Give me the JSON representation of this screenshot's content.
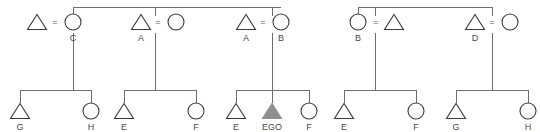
{
  "diagram": {
    "type": "kinship-genealogy",
    "ego_label": "EGO",
    "union_symbol": "=",
    "colors": {
      "line": "#6e6e6e",
      "symbol_stroke": "#3a3a3a",
      "symbol_fill": "#ffffff",
      "ego_fill": "#8f8f8f",
      "label_text": "#4a4a4a",
      "background": "#ffffff"
    },
    "generation_1": {
      "name": "parents-generation",
      "unions": [
        {
          "id": "union-1",
          "left": {
            "shape": "triangle",
            "sex": "male",
            "label": "",
            "cx": 37,
            "cy": 22
          },
          "eq": {
            "x": 55,
            "y": 23
          },
          "right": {
            "shape": "circle",
            "sex": "female",
            "label": "C",
            "cx": 73,
            "cy": 22
          },
          "descent_x": 73
        },
        {
          "id": "union-2",
          "left": {
            "shape": "triangle",
            "sex": "male",
            "label": "A",
            "cx": 141,
            "cy": 22
          },
          "eq": {
            "x": 158,
            "y": 23
          },
          "right": {
            "shape": "circle",
            "sex": "female",
            "label": "",
            "cx": 176,
            "cy": 22
          },
          "descent_x": 155
        },
        {
          "id": "union-3",
          "left": {
            "shape": "triangle",
            "sex": "male",
            "label": "A",
            "cx": 246,
            "cy": 22
          },
          "eq": {
            "x": 263,
            "y": 23
          },
          "right": {
            "shape": "circle",
            "sex": "female",
            "label": "B",
            "cx": 281,
            "cy": 22
          },
          "descent_x": 272
        },
        {
          "id": "union-4",
          "left": {
            "shape": "circle",
            "sex": "female",
            "label": "B",
            "cx": 358,
            "cy": 22
          },
          "eq": {
            "x": 376,
            "y": 23
          },
          "right": {
            "shape": "triangle",
            "sex": "male",
            "label": "",
            "cx": 394,
            "cy": 22
          },
          "descent_x": 375
        },
        {
          "id": "union-5",
          "left": {
            "shape": "triangle",
            "sex": "male",
            "label": "D",
            "cx": 475,
            "cy": 22
          },
          "eq": {
            "x": 492,
            "y": 23
          },
          "right": {
            "shape": "circle",
            "sex": "female",
            "label": "",
            "cx": 510,
            "cy": 22
          },
          "descent_x": 492
        }
      ],
      "sibling_bars": [
        {
          "id": "top-bar-left",
          "y": 7,
          "x1": 73,
          "x2": 281,
          "stubs": [
            73,
            155,
            272
          ]
        },
        {
          "id": "top-bar-right",
          "y": 7,
          "x1": 358,
          "x2": 492,
          "stubs": [
            358,
            375,
            492
          ]
        }
      ]
    },
    "generation_2": {
      "name": "ego-generation",
      "sibling_groups": [
        {
          "id": "sibgroup-1",
          "parent_descent_x": 73,
          "bar_y": 90,
          "bar_x1": 20,
          "bar_x2": 91,
          "children": [
            {
              "shape": "triangle",
              "sex": "male",
              "label": "G",
              "cx": 20,
              "cy": 111,
              "ego": false
            },
            {
              "shape": "circle",
              "sex": "female",
              "label": "H",
              "cx": 91,
              "cy": 111,
              "ego": false
            }
          ]
        },
        {
          "id": "sibgroup-2",
          "parent_descent_x": 155,
          "bar_y": 90,
          "bar_x1": 124,
          "bar_x2": 196,
          "children": [
            {
              "shape": "triangle",
              "sex": "male",
              "label": "E",
              "cx": 124,
              "cy": 111,
              "ego": false
            },
            {
              "shape": "circle",
              "sex": "female",
              "label": "F",
              "cx": 196,
              "cy": 111,
              "ego": false
            }
          ]
        },
        {
          "id": "sibgroup-3",
          "parent_descent_x": 272,
          "bar_y": 90,
          "bar_x1": 236,
          "bar_x2": 309,
          "children": [
            {
              "shape": "triangle",
              "sex": "male",
              "label": "E",
              "cx": 236,
              "cy": 111,
              "ego": false
            },
            {
              "shape": "triangle",
              "sex": "male",
              "label": "EGO",
              "cx": 272,
              "cy": 111,
              "ego": true
            },
            {
              "shape": "circle",
              "sex": "female",
              "label": "F",
              "cx": 309,
              "cy": 111,
              "ego": false
            }
          ]
        },
        {
          "id": "sibgroup-4",
          "parent_descent_x": 375,
          "bar_y": 90,
          "bar_x1": 344,
          "bar_x2": 416,
          "children": [
            {
              "shape": "triangle",
              "sex": "male",
              "label": "E",
              "cx": 344,
              "cy": 111,
              "ego": false
            },
            {
              "shape": "circle",
              "sex": "female",
              "label": "F",
              "cx": 416,
              "cy": 111,
              "ego": false
            }
          ]
        },
        {
          "id": "sibgroup-5",
          "parent_descent_x": 492,
          "bar_y": 90,
          "bar_x1": 456,
          "bar_x2": 528,
          "children": [
            {
              "shape": "triangle",
              "sex": "male",
              "label": "G",
              "cx": 456,
              "cy": 111,
              "ego": false
            },
            {
              "shape": "circle",
              "sex": "female",
              "label": "H",
              "cx": 528,
              "cy": 111,
              "ego": false
            }
          ]
        }
      ]
    }
  }
}
